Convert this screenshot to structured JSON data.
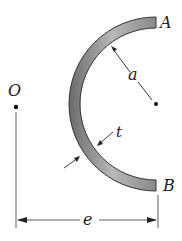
{
  "figure": {
    "labels": {
      "A": "A",
      "B": "B",
      "O": "O",
      "a": "a",
      "t": "t",
      "e": "e"
    }
  }
}
